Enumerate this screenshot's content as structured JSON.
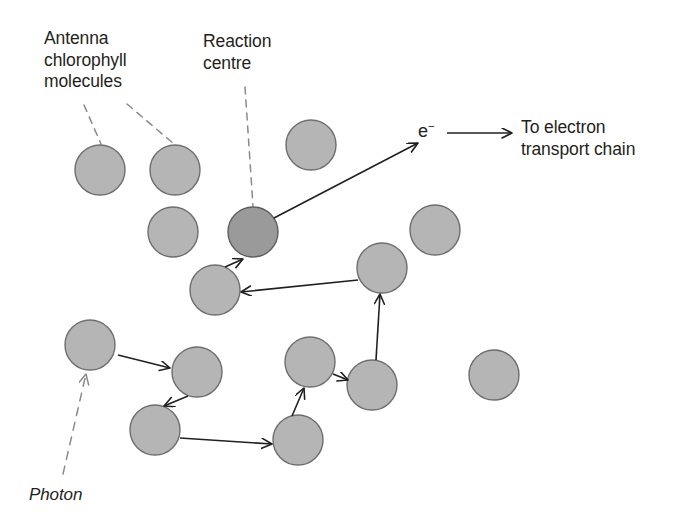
{
  "figure": {
    "kind": "photosynthesis-light-harvesting-diagram",
    "background_color": "#ffffff"
  },
  "labels": {
    "antenna": "Antenna\nchlorophyll\nmolecules",
    "reaction_centre": "Reaction\ncentre",
    "electron_symbol": "e",
    "electron_charge": "−",
    "electron_transport": "To electron\ntransport chain",
    "photon": "Photon"
  },
  "colors": {
    "antenna_fill": "#b5b5b5",
    "antenna_stroke": "#6e6e6e",
    "reaction_centre_fill": "#9a9a9a",
    "reaction_centre_stroke": "#5f5f5f",
    "line": "#231f20",
    "dashed_line": "#8a8a8a",
    "text": "#231f20"
  },
  "molecules": [
    {
      "id": "antenna-1",
      "type": "antenna",
      "cx": 100,
      "cy": 170,
      "r": 25
    },
    {
      "id": "antenna-2",
      "type": "antenna",
      "cx": 175,
      "cy": 170,
      "r": 25
    },
    {
      "id": "antenna-3",
      "type": "antenna",
      "cx": 173,
      "cy": 232,
      "r": 25
    },
    {
      "id": "antenna-4",
      "type": "antenna",
      "cx": 311,
      "cy": 145,
      "r": 25
    },
    {
      "id": "antenna-5",
      "type": "antenna",
      "cx": 435,
      "cy": 230,
      "r": 25
    },
    {
      "id": "antenna-6",
      "type": "antenna",
      "cx": 215,
      "cy": 290,
      "r": 25
    },
    {
      "id": "antenna-7",
      "type": "antenna",
      "cx": 382,
      "cy": 268,
      "r": 25
    },
    {
      "id": "antenna-8",
      "type": "antenna",
      "cx": 90,
      "cy": 345,
      "r": 25
    },
    {
      "id": "antenna-9",
      "type": "antenna",
      "cx": 197,
      "cy": 372,
      "r": 25
    },
    {
      "id": "antenna-10",
      "type": "antenna",
      "cx": 155,
      "cy": 430,
      "r": 25
    },
    {
      "id": "antenna-11",
      "type": "antenna",
      "cx": 310,
      "cy": 362,
      "r": 25
    },
    {
      "id": "antenna-12",
      "type": "antenna",
      "cx": 372,
      "cy": 385,
      "r": 25
    },
    {
      "id": "antenna-13",
      "type": "antenna",
      "cx": 298,
      "cy": 440,
      "r": 25
    },
    {
      "id": "antenna-14",
      "type": "antenna",
      "cx": 494,
      "cy": 375,
      "r": 25
    },
    {
      "id": "reaction-centre",
      "type": "reaction-centre",
      "cx": 253,
      "cy": 232,
      "r": 25
    }
  ],
  "energy_transfer_arrows": [
    {
      "id": "transfer-1",
      "from": "antenna-8",
      "to": "antenna-9",
      "x1": 118,
      "y1": 355,
      "x2": 170,
      "y2": 368
    },
    {
      "id": "transfer-2",
      "from": "antenna-9",
      "to": "antenna-10",
      "x1": 188,
      "y1": 396,
      "x2": 164,
      "y2": 406
    },
    {
      "id": "transfer-3",
      "from": "antenna-10",
      "to": "antenna-13",
      "x1": 180,
      "y1": 438,
      "x2": 272,
      "y2": 444
    },
    {
      "id": "transfer-4",
      "from": "antenna-13",
      "to": "antenna-11",
      "x1": 292,
      "y1": 416,
      "x2": 304,
      "y2": 388
    },
    {
      "id": "transfer-5",
      "from": "antenna-11",
      "to": "antenna-12",
      "x1": 333,
      "y1": 374,
      "x2": 348,
      "y2": 380
    },
    {
      "id": "transfer-6",
      "from": "antenna-12",
      "to": "antenna-7",
      "x1": 376,
      "y1": 360,
      "x2": 380,
      "y2": 294
    },
    {
      "id": "transfer-7",
      "from": "antenna-7",
      "to": "antenna-6",
      "x1": 358,
      "y1": 280,
      "x2": 241,
      "y2": 292
    },
    {
      "id": "transfer-8",
      "from": "antenna-6",
      "to": "reaction-centre",
      "x1": 225,
      "y1": 267,
      "x2": 243,
      "y2": 259
    }
  ],
  "electron_arrow": {
    "id": "electron-emission",
    "from": "reaction-centre",
    "x1": 274,
    "y1": 218,
    "x2": 418,
    "y2": 143
  },
  "electron_transport_arrow": {
    "id": "electron-transport-arrow",
    "x1": 447,
    "y1": 133,
    "x2": 512,
    "y2": 133
  },
  "leader_lines": [
    {
      "id": "leader-antenna-1",
      "x1": 84,
      "y1": 105,
      "x2": 101,
      "y2": 144
    },
    {
      "id": "leader-antenna-2",
      "x1": 127,
      "y1": 104,
      "x2": 174,
      "y2": 144
    },
    {
      "id": "leader-reaction",
      "x1": 245,
      "y1": 87,
      "x2": 253,
      "y2": 206
    }
  ],
  "photon_arrow": {
    "id": "photon-arrow",
    "x1": 63,
    "y1": 474,
    "x2": 86,
    "y2": 374
  }
}
